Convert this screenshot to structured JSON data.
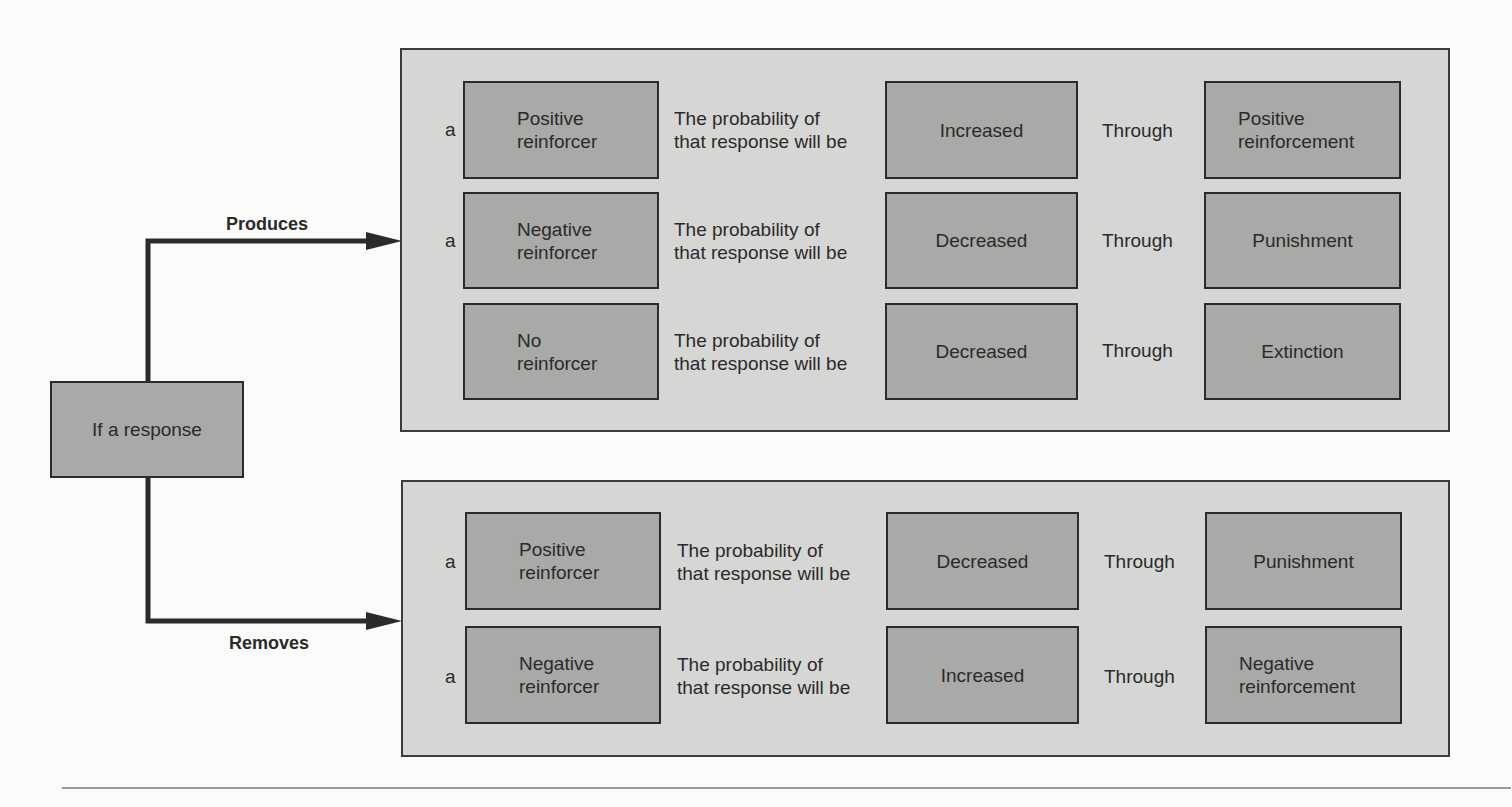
{
  "diagram": {
    "source_box": "If a response",
    "branches": [
      {
        "label": "Produces",
        "rows": [
          {
            "article": "a",
            "stimulus": "Positive\nreinforcer",
            "phrase": "The probability of\nthat response will be",
            "effect": "Increased",
            "connector": "Through",
            "process": "Positive\nreinforcement"
          },
          {
            "article": "a",
            "stimulus": "Negative\nreinforcer",
            "phrase": "The probability of\nthat response will be",
            "effect": "Decreased",
            "connector": "Through",
            "process": "Punishment"
          },
          {
            "article": "",
            "stimulus": "No\nreinforcer",
            "phrase": "The probability of\nthat response will be",
            "effect": "Decreased",
            "connector": "Through",
            "process": "Extinction"
          }
        ]
      },
      {
        "label": "Removes",
        "rows": [
          {
            "article": "a",
            "stimulus": "Positive\nreinforcer",
            "phrase": "The probability of\nthat response will be",
            "effect": "Decreased",
            "connector": "Through",
            "process": "Punishment"
          },
          {
            "article": "a",
            "stimulus": "Negative\nreinforcer",
            "phrase": "The probability of\nthat response will be",
            "effect": "Increased",
            "connector": "Through",
            "process": "Negative\nreinforcement"
          }
        ]
      }
    ]
  },
  "colors": {
    "panel": "#d6d6d5",
    "box": "#a9a9a8",
    "stroke": "#2b2b2b",
    "background": "#fbfbfa"
  }
}
